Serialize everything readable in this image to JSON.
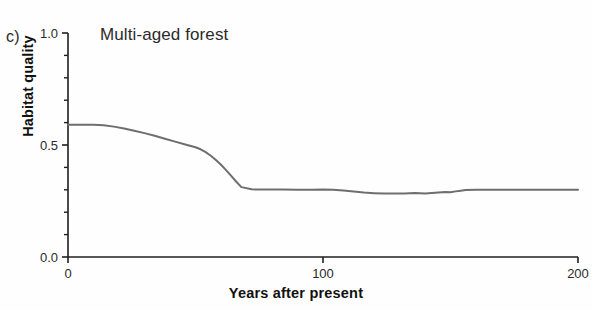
{
  "panel": {
    "label": "c)"
  },
  "chart_data": {
    "type": "line",
    "title": "Multi-aged forest",
    "xlabel": "Years after present",
    "ylabel": "Habitat quality",
    "xlim": [
      0,
      200
    ],
    "ylim": [
      0.0,
      1.0
    ],
    "grid": false,
    "legend": "none",
    "line_color": "#6e6e6e",
    "axis_color": "#1f1f1f",
    "xticks": [
      0,
      100,
      200
    ],
    "xtick_labels": [
      "0",
      "100",
      "200"
    ],
    "yticks": [
      0.0,
      0.5,
      1.0
    ],
    "ytick_labels": [
      "0.0",
      "0.5",
      "1.0"
    ],
    "y_minor_ticks": [
      0.1,
      0.2,
      0.3,
      0.4,
      0.6,
      0.7,
      0.8,
      0.9
    ],
    "series": [
      {
        "name": "Multi-aged forest",
        "x": [
          0,
          5,
          10,
          14,
          18,
          22,
          26,
          30,
          34,
          38,
          42,
          46,
          50,
          52,
          54,
          56,
          58,
          60,
          62,
          64,
          66,
          68,
          72,
          78,
          84,
          90,
          96,
          100,
          104,
          108,
          112,
          116,
          120,
          124,
          128,
          132,
          136,
          140,
          144,
          148,
          150,
          152,
          154,
          156,
          160,
          166,
          172,
          178,
          184,
          190,
          196,
          200
        ],
        "y": [
          0.59,
          0.59,
          0.59,
          0.588,
          0.582,
          0.574,
          0.564,
          0.553,
          0.541,
          0.528,
          0.515,
          0.502,
          0.49,
          0.481,
          0.468,
          0.452,
          0.433,
          0.412,
          0.388,
          0.362,
          0.336,
          0.312,
          0.302,
          0.301,
          0.301,
          0.3,
          0.3,
          0.301,
          0.3,
          0.297,
          0.292,
          0.288,
          0.285,
          0.283,
          0.284,
          0.283,
          0.286,
          0.284,
          0.287,
          0.29,
          0.289,
          0.293,
          0.296,
          0.299,
          0.3,
          0.3,
          0.3,
          0.3,
          0.3,
          0.3,
          0.3,
          0.3
        ]
      }
    ]
  }
}
